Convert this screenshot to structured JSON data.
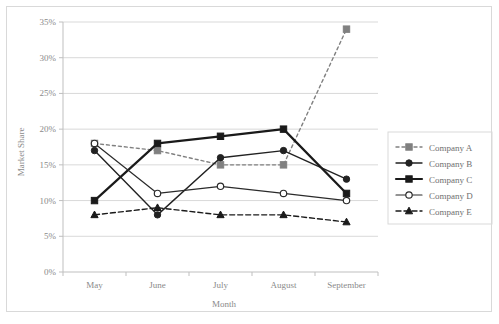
{
  "chart_data": {
    "type": "line",
    "title": "",
    "xlabel": "Month",
    "ylabel": "Market Share",
    "categories": [
      "May",
      "June",
      "July",
      "August",
      "September"
    ],
    "ylim": [
      0,
      35
    ],
    "ytick_step": 5,
    "ytick_labels": [
      "0%",
      "5%",
      "10%",
      "15%",
      "20%",
      "25%",
      "30%",
      "35%"
    ],
    "ytick_values": [
      0,
      5,
      10,
      15,
      20,
      25,
      30,
      35
    ],
    "grid": true,
    "legend_position": "right",
    "series": [
      {
        "name": "Company A",
        "values": [
          18,
          17,
          15,
          15,
          34
        ],
        "color": "#808080",
        "marker": "square",
        "marker_filled": true,
        "dash": "3,3",
        "width": 1.4
      },
      {
        "name": "Company B",
        "values": [
          17,
          8,
          16,
          17,
          13
        ],
        "color": "#222222",
        "marker": "circle",
        "marker_filled": true,
        "dash": "none",
        "width": 1.4
      },
      {
        "name": "Company C",
        "values": [
          10,
          18,
          19,
          20,
          11
        ],
        "color": "#1a1a1a",
        "marker": "square",
        "marker_filled": true,
        "dash": "none",
        "width": 2.2
      },
      {
        "name": "Company D",
        "values": [
          18,
          11,
          12,
          11,
          10
        ],
        "color": "#2b2b2b",
        "marker": "circle-open",
        "marker_filled": false,
        "dash": "none",
        "width": 1.2
      },
      {
        "name": "Company E",
        "values": [
          8,
          9,
          8,
          8,
          7
        ],
        "color": "#1a1a1a",
        "marker": "triangle",
        "marker_filled": true,
        "dash": "5,3",
        "width": 1.4
      }
    ]
  },
  "legend": {
    "entries": [
      "Company A",
      "Company B",
      "Company C",
      "Company D",
      "Company E"
    ]
  },
  "colors": {
    "grid": "#d9d9d9",
    "axis": "#bfbfbf",
    "tick_text": "#8a8a8a",
    "legend_text": "#6f6f6f",
    "border": "#d9d9d9",
    "background": "#ffffff"
  }
}
